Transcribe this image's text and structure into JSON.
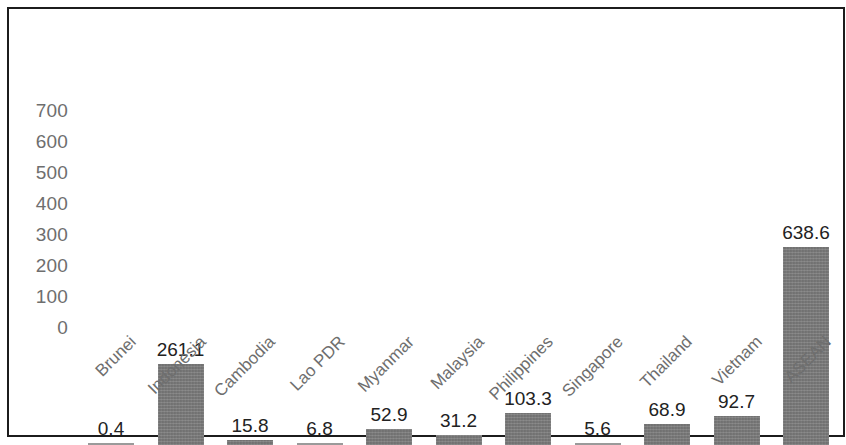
{
  "chart_data": {
    "type": "bar",
    "title": "",
    "subtitle": "",
    "xlabel": "",
    "ylabel": "",
    "ylim": [
      0,
      700
    ],
    "y_ticks": [
      "0",
      "100",
      "200",
      "300",
      "400",
      "500",
      "600",
      "700"
    ],
    "grid": false,
    "legend": null,
    "categories": [
      "Brunei",
      "Indonesia",
      "Cambodia",
      "Lao PDR",
      "Myanmar",
      "Malaysia",
      "Philippines",
      "Singapore",
      "Thailand",
      "Vietnam",
      "ASEAN"
    ],
    "values": [
      0.4,
      261.1,
      15.8,
      6.8,
      52.9,
      31.2,
      103.3,
      5.6,
      68.9,
      92.7,
      638.6
    ],
    "value_labels": [
      "0.4",
      "261.1",
      "15.8",
      "6.8",
      "52.9",
      "31.2",
      "103.3",
      "5.6",
      "68.9",
      "92.7",
      "638.6"
    ],
    "bar_color": "#7d7d7d",
    "axis_text_color": "#6e6e6e",
    "value_text_color": "#222222",
    "background_color": "#ffffff",
    "frame_color": "#1c1c1c"
  }
}
